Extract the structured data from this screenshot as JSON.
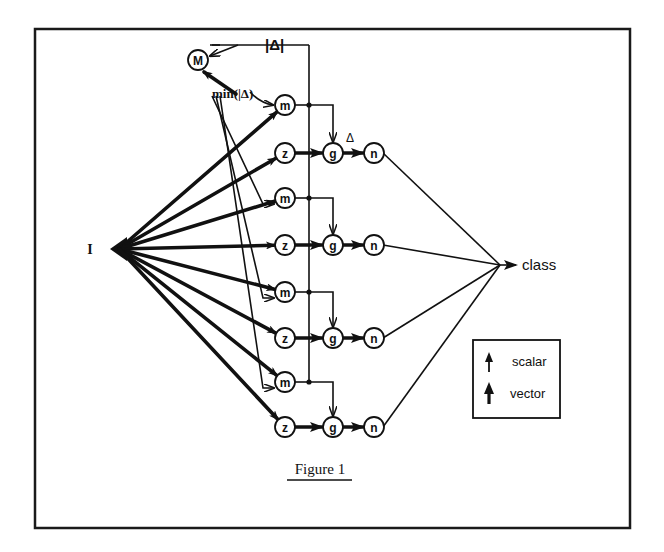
{
  "figure": {
    "caption": "Figure 1",
    "input_label": "I",
    "output_label": "class",
    "abs_delta_label": "|Δ|",
    "min_label": "min(|Δ)",
    "delta_label": "Δ",
    "max_node_label": "M",
    "node_labels": {
      "m": "m",
      "z": "z",
      "g": "g",
      "n": "n"
    }
  },
  "legend": {
    "items": [
      {
        "label": "scalar",
        "arrow": "thin-arrow-icon"
      },
      {
        "label": "vector",
        "arrow": "thick-arrow-icon"
      }
    ]
  },
  "diagram": {
    "rows": [
      {
        "m_y": 105,
        "z_y": 153
      },
      {
        "m_y": 198,
        "z_y": 245
      },
      {
        "m_y": 292,
        "z_y": 338
      },
      {
        "m_y": 382,
        "z_y": 427
      }
    ],
    "columns": {
      "mz_x": 285,
      "bus_x": 309,
      "g_x": 333,
      "n_x": 374
    },
    "input_point": [
      113,
      249
    ],
    "class_point": [
      500,
      265
    ],
    "max_node": [
      198,
      60
    ]
  }
}
